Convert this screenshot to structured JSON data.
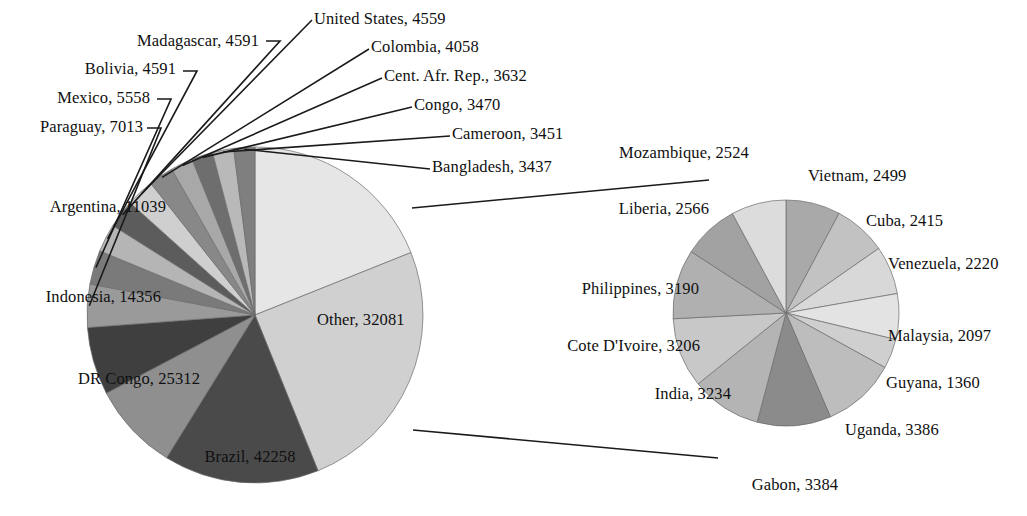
{
  "chart_data": {
    "type": "pie",
    "title": "",
    "subtitle": "",
    "xlabel": "",
    "ylabel": "",
    "legend": "none",
    "grid": false,
    "variant": "pie-of-pie",
    "label_format": "name, value",
    "primary": {
      "name": "Main pie",
      "start_angle_deg": 0,
      "direction": "clockwise",
      "total": 197296,
      "categories": [
        "Other",
        "Brazil",
        "DR Congo",
        "Indonesia",
        "Argentina",
        "Paraguay",
        "Mexico",
        "Bolivia",
        "Madagascar",
        "United States",
        "Colombia",
        "Cent. Afr. Rep.",
        "Congo",
        "Cameroon",
        "Bangladesh"
      ],
      "values": [
        32081,
        42258,
        25312,
        14356,
        11039,
        7013,
        5558,
        4591,
        4591,
        4559,
        4058,
        3632,
        3470,
        3451,
        3437
      ],
      "colors": [
        "#e6e6e6",
        "#d0d0d0",
        "#4a4a4a",
        "#8f8f8f",
        "#3f3f3f",
        "#9a9a9a",
        "#7a7a7a",
        "#b5b5b5",
        "#5c5c5c",
        "#cfcfcf",
        "#888888",
        "#a8a8a8",
        "#6e6e6e",
        "#b9b9b9",
        "#7f7f7f"
      ],
      "labels": [
        {
          "name": "Other",
          "value": "32081",
          "text": "Other, 32081"
        },
        {
          "name": "Brazil",
          "value": "42258",
          "text": "Brazil, 42258"
        },
        {
          "name": "DR Congo",
          "value": "25312",
          "text": "DR Congo, 25312"
        },
        {
          "name": "Indonesia",
          "value": "14356",
          "text": "Indonesia, 14356"
        },
        {
          "name": "Argentina",
          "value": "11039",
          "text": "Argentina, 11039"
        },
        {
          "name": "Paraguay",
          "value": "7013",
          "text": "Paraguay, 7013"
        },
        {
          "name": "Mexico",
          "value": "5558",
          "text": "Mexico, 5558"
        },
        {
          "name": "Bolivia",
          "value": "4591",
          "text": "Bolivia, 4591"
        },
        {
          "name": "Madagascar",
          "value": "4591",
          "text": "Madagascar, 4591"
        },
        {
          "name": "United States",
          "value": "4559",
          "text": "United States, 4559"
        },
        {
          "name": "Colombia",
          "value": "4058",
          "text": "Colombia, 4058"
        },
        {
          "name": "Cent. Afr. Rep.",
          "value": "3632",
          "text": "Cent. Afr. Rep., 3632"
        },
        {
          "name": "Congo",
          "value": "3470",
          "text": "Congo, 3470"
        },
        {
          "name": "Cameroon",
          "value": "3451",
          "text": "Cameroon, 3451"
        },
        {
          "name": "Bangladesh",
          "value": "3437",
          "text": "Bangladesh, 3437"
        }
      ]
    },
    "secondary": {
      "name": "Other breakdown",
      "parent_slice": "Other",
      "start_angle_deg": 0,
      "direction": "clockwise",
      "total": 32081,
      "categories": [
        "Vietnam",
        "Cuba",
        "Venezuela",
        "Malaysia",
        "Guyana",
        "Uganda",
        "Gabon",
        "India",
        "Cote D'Ivoire",
        "Philippines",
        "Liberia",
        "Mozambique"
      ],
      "values": [
        2499,
        2415,
        2220,
        2097,
        1360,
        3386,
        3384,
        3234,
        3206,
        3190,
        2566,
        2524
      ],
      "colors": [
        "#a9a9a9",
        "#c2c2c2",
        "#d8d8d8",
        "#e3e3e3",
        "#cfcfcf",
        "#bdbdbd",
        "#8b8b8b",
        "#b4b4b4",
        "#c8c8c8",
        "#b0b0b0",
        "#a2a2a2",
        "#dcdcdc"
      ],
      "labels": [
        {
          "name": "Vietnam",
          "value": "2499",
          "text": "Vietnam, 2499"
        },
        {
          "name": "Cuba",
          "value": "2415",
          "text": "Cuba, 2415"
        },
        {
          "name": "Venezuela",
          "value": "2220",
          "text": "Venezuela, 2220"
        },
        {
          "name": "Malaysia",
          "value": "2097",
          "text": "Malaysia, 2097"
        },
        {
          "name": "Guyana",
          "value": "1360",
          "text": "Guyana, 1360"
        },
        {
          "name": "Uganda",
          "value": "3386",
          "text": "Uganda, 3386"
        },
        {
          "name": "Gabon",
          "value": "3384",
          "text": "Gabon, 3384"
        },
        {
          "name": "India",
          "value": "3234",
          "text": "India, 3234"
        },
        {
          "name": "Cote D'Ivoire",
          "value": "3206",
          "text": "Cote D'Ivoire, 3206"
        },
        {
          "name": "Philippines",
          "value": "3190",
          "text": "Philippines, 3190"
        },
        {
          "name": "Liberia",
          "value": "2566",
          "text": "Liberia, 2566"
        },
        {
          "name": "Mozambique",
          "value": "2524",
          "text": "Mozambique, 2524"
        }
      ]
    }
  },
  "labels": {
    "madagascar": "Madagascar, 4591",
    "bolivia": "Bolivia, 4591",
    "mexico": "Mexico, 5558",
    "paraguay": "Paraguay, 7013",
    "argentina": "Argentina, 11039",
    "indonesia": "Indonesia, 14356",
    "dr_congo": "DR Congo, 25312",
    "brazil": "Brazil, 42258",
    "other": "Other, 32081",
    "united_states": "United States, 4559",
    "colombia": "Colombia, 4058",
    "cent_afr_rep": "Cent. Afr. Rep., 3632",
    "congo": "Congo, 3470",
    "cameroon": "Cameroon, 3451",
    "bangladesh": "Bangladesh, 3437",
    "mozambique": "Mozambique, 2524",
    "liberia": "Liberia, 2566",
    "philippines": "Philippines, 3190",
    "cote_divoire": "Cote D'Ivoire, 3206",
    "india": "India, 3234",
    "gabon": "Gabon, 3384",
    "uganda": "Uganda, 3386",
    "guyana": "Guyana, 1360",
    "malaysia": "Malaysia, 2097",
    "venezuela": "Venezuela, 2220",
    "cuba": "Cuba, 2415",
    "vietnam": "Vietnam, 2499"
  },
  "colors": {
    "background": "#ffffff",
    "text": "#101010",
    "leader_line": "#1a1a1a",
    "slice_edge": "#6b6b6b"
  }
}
